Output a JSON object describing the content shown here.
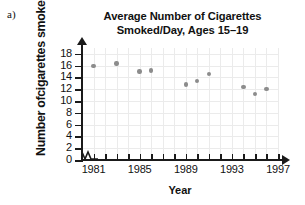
{
  "item_label": "a)",
  "chart_data": {
    "type": "scatter",
    "title": "Average Number of Cigarettes Smoked/Day, Ages 15–19",
    "title_lines": [
      "Average Number of Cigarettes",
      "Smoked/Day, Ages 15–19"
    ],
    "xlabel": "Year",
    "ylabel": "Number ofcigarettes smoked/day",
    "xlim": [
      1980,
      1997
    ],
    "ylim": [
      0,
      19
    ],
    "xticks": [
      1981,
      1982,
      1983,
      1984,
      1985,
      1986,
      1987,
      1988,
      1989,
      1990,
      1991,
      1992,
      1993,
      1994,
      1995,
      1996,
      1997
    ],
    "xtick_labels": [
      "1981",
      "1985",
      "1989",
      "1993",
      "1997"
    ],
    "xtick_label_values": [
      1981,
      1985,
      1989,
      1993,
      1997
    ],
    "yticks": [
      0,
      2,
      4,
      6,
      8,
      10,
      12,
      14,
      16,
      18
    ],
    "ytick_labels": [
      "0",
      "2",
      "4",
      "6",
      "8",
      "10",
      "12",
      "14",
      "16",
      "18"
    ],
    "grid": true,
    "legend": false,
    "axis_break": true,
    "marker_color": "#8c8c8c",
    "grid_color": "#ebebeb",
    "axis_color": "#1a1a1a",
    "x": [
      1981,
      1983,
      1985,
      1986,
      1989,
      1990,
      1991,
      1994,
      1995,
      1996
    ],
    "values": [
      15.9,
      16.4,
      15.0,
      15.2,
      12.8,
      13.4,
      14.6,
      12.4,
      11.2,
      12.0
    ],
    "points": [
      {
        "year": 1981,
        "value": 15.9
      },
      {
        "year": 1983,
        "value": 16.4
      },
      {
        "year": 1985,
        "value": 15.0
      },
      {
        "year": 1986,
        "value": 15.2
      },
      {
        "year": 1989,
        "value": 12.8
      },
      {
        "year": 1990,
        "value": 13.4
      },
      {
        "year": 1991,
        "value": 14.6
      },
      {
        "year": 1994,
        "value": 12.4
      },
      {
        "year": 1995,
        "value": 11.2
      },
      {
        "year": 1996,
        "value": 12.0
      }
    ]
  }
}
